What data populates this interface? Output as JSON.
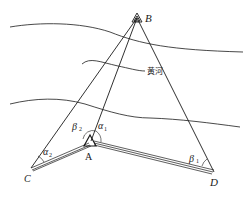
{
  "diagram": {
    "type": "surveying-triangulation-across-river",
    "river_label": "黄河",
    "points": {
      "B": {
        "label": "B"
      },
      "A": {
        "label": "A"
      },
      "C": {
        "label": "C"
      },
      "D": {
        "label": "D"
      }
    },
    "angles": {
      "alpha1": {
        "symbol": "α",
        "sub": "1"
      },
      "alpha2": {
        "symbol": "α",
        "sub": "2"
      },
      "beta1": {
        "symbol": "β",
        "sub": "1"
      },
      "beta2": {
        "symbol": "β",
        "sub": "2"
      }
    },
    "colors": {
      "ink": "#1a1a1a",
      "background": "#ffffff"
    }
  }
}
